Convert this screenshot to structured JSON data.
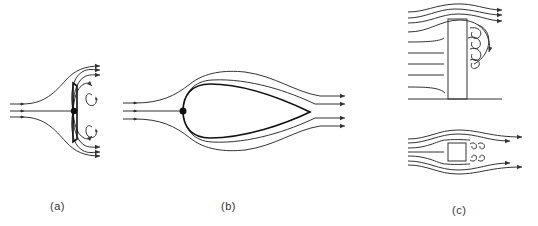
{
  "figure": {
    "panels": [
      {
        "id": "a",
        "label": "(a)",
        "description": "Flow normal to a flat plate with stagnation point and recirculating vortices behind"
      },
      {
        "id": "b",
        "label": "(b)",
        "description": "Flow around a streamlined teardrop body with stagnation point at the nose"
      },
      {
        "id": "c",
        "label": "(c)",
        "description": "Flow over a tall bluff body on a ground plane (top) and flow around a square cylinder with wake vortices (bottom)"
      }
    ],
    "colors": {
      "stroke": "#333333",
      "body": "#111111",
      "background": "#ffffff"
    }
  }
}
